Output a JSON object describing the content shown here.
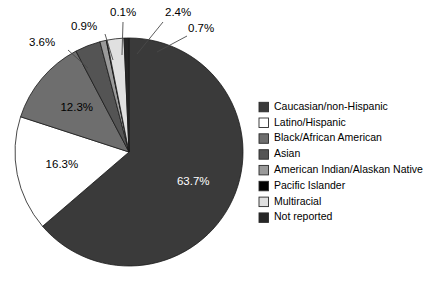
{
  "chart_data": {
    "type": "pie",
    "title": "",
    "subtitle": "",
    "xlabel": "",
    "ylabel": "",
    "grid": false,
    "legend_position": "right",
    "start_angle_deg": 0,
    "direction": "clockwise",
    "units": "percent",
    "categories": [
      "Caucasian/non-Hispanic",
      "Latino/Hispanic",
      "Black/African American",
      "Asian",
      "American Indian/Alaskan Native",
      "Pacific Islander",
      "Multiracial",
      "Not reported"
    ],
    "values": [
      63.7,
      16.3,
      12.3,
      3.6,
      0.9,
      0.1,
      2.4,
      0.7
    ],
    "value_labels": [
      "63.7%",
      "16.3%",
      "12.3%",
      "3.6%",
      "0.9%",
      "0.1%",
      "2.4%",
      "0.7%"
    ],
    "colors": [
      "#3a3a3a",
      "#ffffff",
      "#6e6e6e",
      "#545454",
      "#9a9a9a",
      "#000000",
      "#e0e0e0",
      "#262626"
    ],
    "label_text_colors": [
      "#ffffff",
      "#000000",
      "#000000",
      "#000000",
      "#000000",
      "#000000",
      "#000000",
      "#000000"
    ],
    "label_placement": [
      "inside",
      "inside",
      "inside",
      "outside",
      "outside",
      "outside",
      "outside",
      "outside"
    ]
  },
  "legend": {
    "items": [
      {
        "label": "Caucasian/non-Hispanic",
        "color": "#3a3a3a"
      },
      {
        "label": "Latino/Hispanic",
        "color": "#ffffff"
      },
      {
        "label": "Black/African American",
        "color": "#6e6e6e"
      },
      {
        "label": "Asian",
        "color": "#545454"
      },
      {
        "label": "American Indian/Alaskan Native",
        "color": "#9a9a9a"
      },
      {
        "label": "Pacific Islander",
        "color": "#000000"
      },
      {
        "label": "Multiracial",
        "color": "#e0e0e0"
      },
      {
        "label": "Not reported",
        "color": "#262626"
      }
    ]
  },
  "layout": {
    "pie_center_x": 129,
    "pie_center_y": 152,
    "pie_radius": 114,
    "legend_x": 259,
    "legend_y": 107,
    "legend_row_height": 15.8,
    "legend_swatch_size": 9.5,
    "legend_text_offset": 15
  },
  "outer_label_positions": [
    {
      "label": "3.6%",
      "tx": 29,
      "ty": 43,
      "anchor": "start",
      "lx1": 68,
      "ly1": 50,
      "lx2": 88,
      "ly2": 68
    },
    {
      "label": "0.9%",
      "tx": 71,
      "ty": 27,
      "anchor": "start",
      "lx1": 105,
      "ly1": 34,
      "lx2": 113,
      "ly2": 60
    },
    {
      "label": "0.1%",
      "tx": 110,
      "ty": 13,
      "anchor": "start",
      "lx1": 123,
      "ly1": 22,
      "lx2": 122,
      "ly2": 55
    },
    {
      "label": "2.4%",
      "tx": 165,
      "ty": 13,
      "anchor": "start",
      "lx1": 163,
      "ly1": 22,
      "lx2": 137,
      "ly2": 54
    },
    {
      "label": "0.7%",
      "tx": 188,
      "ty": 29,
      "anchor": "start",
      "lx1": 187,
      "ly1": 36,
      "lx2": 157,
      "ly2": 52
    }
  ]
}
